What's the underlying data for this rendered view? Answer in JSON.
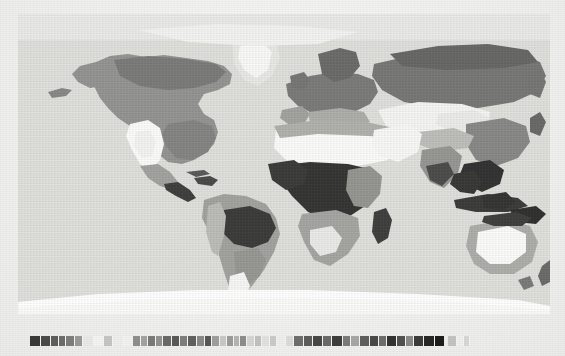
{
  "document": {
    "type": "printed-figure",
    "title": "World map",
    "description": "Grayscale halftone world map of global land-cover / climate zones on a pseudo-cylindrical projection, with a horizontal graded legend strip beneath the map.",
    "background_color": "#f1f1ef",
    "paper_tint": "#f4f4f2"
  },
  "map": {
    "name": "world-biome-map",
    "projection": "pseudo-cylindrical (Robinson-like)",
    "ocean_color": "#dcdcd8",
    "graticule_visible": false,
    "labels_visible": false,
    "regions": [
      {
        "name": "North America",
        "dominant_tone": "#8a8a88"
      },
      {
        "name": "Greenland",
        "dominant_tone": "#c8c8c4"
      },
      {
        "name": "South America",
        "dominant_tone": "#9a9a96"
      },
      {
        "name": "Amazon Basin",
        "dominant_tone": "#2e2e2c"
      },
      {
        "name": "Europe",
        "dominant_tone": "#6f6f6d"
      },
      {
        "name": "Sahara",
        "dominant_tone": "#fbfbf9"
      },
      {
        "name": "Sahel",
        "dominant_tone": "#a9a9a5"
      },
      {
        "name": "Congo Basin",
        "dominant_tone": "#242422"
      },
      {
        "name": "Southern Africa",
        "dominant_tone": "#9d9d99"
      },
      {
        "name": "Arabian Peninsula",
        "dominant_tone": "#f7f7f5"
      },
      {
        "name": "Siberia",
        "dominant_tone": "#6b6b69"
      },
      {
        "name": "Central Asia",
        "dominant_tone": "#f4f4f2"
      },
      {
        "name": "India",
        "dominant_tone": "#8d8d89"
      },
      {
        "name": "Southeast Asia",
        "dominant_tone": "#202020"
      },
      {
        "name": "Australia",
        "dominant_tone": "#fbfbf9"
      },
      {
        "name": "Australia interior rim",
        "dominant_tone": "#a6a6a2"
      },
      {
        "name": "Antarctica",
        "dominant_tone": "#ffffff"
      }
    ]
  },
  "legend": {
    "name": "map-legend",
    "orientation": "horizontal",
    "x": 30,
    "y": 336,
    "height": 10,
    "labels_visible": false,
    "swatches": [
      {
        "index": 1,
        "color": "#3a3a38",
        "width": 10
      },
      {
        "index": 2,
        "color": "#4b4b49",
        "width": 9
      },
      {
        "index": 3,
        "color": "#5e5e5c",
        "width": 7
      },
      {
        "index": 4,
        "color": "#6d6d6b",
        "width": 6
      },
      {
        "index": 5,
        "color": "#7e7e7c",
        "width": 8
      },
      {
        "index": 6,
        "color": "#9a9a98",
        "width": 7
      },
      {
        "index": 7,
        "color": "#eaeae8",
        "width": 10
      },
      {
        "index": 8,
        "color": "#f4f4f2",
        "width": 9
      },
      {
        "index": 9,
        "color": "#c6c6c4",
        "width": 8
      },
      {
        "index": 10,
        "color": "#efefed",
        "width": 10
      },
      {
        "index": 11,
        "color": "#f2f2f0",
        "width": 8
      },
      {
        "index": 12,
        "color": "#8f8f8d",
        "width": 7
      },
      {
        "index": 13,
        "color": "#a4a4a2",
        "width": 6
      },
      {
        "index": 14,
        "color": "#7a7a78",
        "width": 7
      },
      {
        "index": 15,
        "color": "#939391",
        "width": 6
      },
      {
        "index": 16,
        "color": "#6a6a68",
        "width": 8
      },
      {
        "index": 17,
        "color": "#5a5a58",
        "width": 7
      },
      {
        "index": 18,
        "color": "#7f7f7d",
        "width": 7
      },
      {
        "index": 19,
        "color": "#626260",
        "width": 8
      },
      {
        "index": 20,
        "color": "#8b8b89",
        "width": 7
      },
      {
        "index": 21,
        "color": "#585856",
        "width": 6
      },
      {
        "index": 22,
        "color": "#a0a09e",
        "width": 7
      },
      {
        "index": 23,
        "color": "#c9c9c7",
        "width": 6
      },
      {
        "index": 24,
        "color": "#9c9c9a",
        "width": 6
      },
      {
        "index": 25,
        "color": "#b5b5b3",
        "width": 5
      },
      {
        "index": 26,
        "color": "#8e8e8c",
        "width": 6
      },
      {
        "index": 27,
        "color": "#d6d6d4",
        "width": 7
      },
      {
        "index": 28,
        "color": "#c2c2c0",
        "width": 6
      },
      {
        "index": 29,
        "color": "#e2e2e0",
        "width": 7
      },
      {
        "index": 30,
        "color": "#cbcbc9",
        "width": 6
      },
      {
        "index": 31,
        "color": "#efefed",
        "width": 8
      },
      {
        "index": 32,
        "color": "#dcdcda",
        "width": 7
      },
      {
        "index": 33,
        "color": "#6f6f6d",
        "width": 9
      },
      {
        "index": 34,
        "color": "#5c5c5a",
        "width": 8
      },
      {
        "index": 35,
        "color": "#484846",
        "width": 9
      },
      {
        "index": 36,
        "color": "#6b6b69",
        "width": 8
      },
      {
        "index": 37,
        "color": "#3e3e3c",
        "width": 10
      },
      {
        "index": 38,
        "color": "#7c7c7a",
        "width": 7
      },
      {
        "index": 39,
        "color": "#a8a8a6",
        "width": 8
      },
      {
        "index": 40,
        "color": "#5f5f5d",
        "width": 9
      },
      {
        "index": 41,
        "color": "#4a4a48",
        "width": 8
      },
      {
        "index": 42,
        "color": "#6e6e6c",
        "width": 7
      },
      {
        "index": 43,
        "color": "#333331",
        "width": 9
      },
      {
        "index": 44,
        "color": "#525250",
        "width": 8
      },
      {
        "index": 45,
        "color": "#8b8b89",
        "width": 7
      },
      {
        "index": 46,
        "color": "#3c3c3a",
        "width": 9
      },
      {
        "index": 47,
        "color": "#272725",
        "width": 10
      },
      {
        "index": 48,
        "color": "#1c1c1a",
        "width": 9
      }
    ],
    "tail_swatches": [
      {
        "index": 49,
        "color": "#c4c4c2",
        "width": 8
      },
      {
        "index": 50,
        "color": "#f0f0ee",
        "width": 6
      },
      {
        "index": 51,
        "color": "#d8d8d6",
        "width": 5
      },
      {
        "index": 52,
        "color": "#ededeb",
        "width": 6
      }
    ]
  }
}
